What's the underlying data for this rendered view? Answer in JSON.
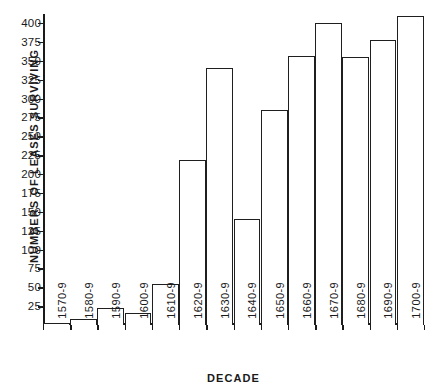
{
  "chart_data": {
    "type": "bar",
    "title": "",
    "xlabel": "DECADE",
    "ylabel": "NUMBERS OF LEASES SURVIVING",
    "categories": [
      "1570-9",
      "1580-9",
      "1590-9",
      "1600-9",
      "1610-9",
      "1620-9",
      "1630-9",
      "1640-9",
      "1650-9",
      "1660-9",
      "1670-9",
      "1680-9",
      "1690-9",
      "1700-9"
    ],
    "values": [
      2,
      8,
      22,
      16,
      54,
      218,
      340,
      141,
      285,
      357,
      400,
      355,
      377,
      410
    ],
    "ylim": [
      0,
      412
    ],
    "yticks": [
      25,
      50,
      75,
      100,
      125,
      150,
      175,
      200,
      225,
      250,
      275,
      300,
      325,
      350,
      375,
      400
    ],
    "ytick_labels": [
      "25",
      "50",
      "75",
      "100",
      "125",
      "150",
      "175",
      "200",
      "225",
      "250",
      "275",
      "300",
      "325",
      "350",
      "375",
      "400"
    ],
    "grid": false,
    "legend": null,
    "bar_style": {
      "fill": "#ffffff",
      "edge": "#1f1f1f"
    }
  },
  "axes": {
    "y_axis_title": "NUMBERS OF LEASES SURVIVING",
    "x_axis_title": "DECADE"
  }
}
